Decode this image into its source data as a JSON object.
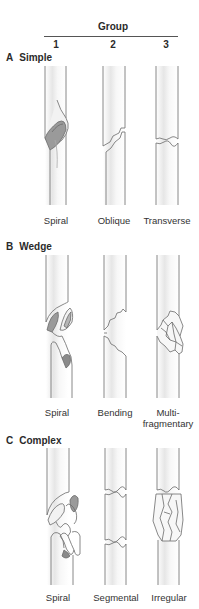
{
  "header": {
    "title": "Group",
    "columns": [
      "1",
      "2",
      "3"
    ]
  },
  "sections": [
    {
      "letter": "A",
      "name": "Simple",
      "items": [
        {
          "group": "1",
          "label": "Spiral"
        },
        {
          "group": "2",
          "label": "Oblique"
        },
        {
          "group": "3",
          "label": "Transverse"
        }
      ]
    },
    {
      "letter": "B",
      "name": "Wedge",
      "items": [
        {
          "group": "1",
          "label": "Spiral"
        },
        {
          "group": "2",
          "label": "Bending"
        },
        {
          "group": "3",
          "label": "Multi-",
          "label2": "fragmentary"
        }
      ]
    },
    {
      "letter": "C",
      "name": "Complex",
      "items": [
        {
          "group": "1",
          "label": "Spiral"
        },
        {
          "group": "2",
          "label": "Segmental"
        },
        {
          "group": "3",
          "label": "Irregular"
        }
      ]
    }
  ],
  "colors": {
    "outline": "#6b6b6b",
    "shade": "#d8d8d8",
    "dark_shade": "#8a8a8a"
  }
}
